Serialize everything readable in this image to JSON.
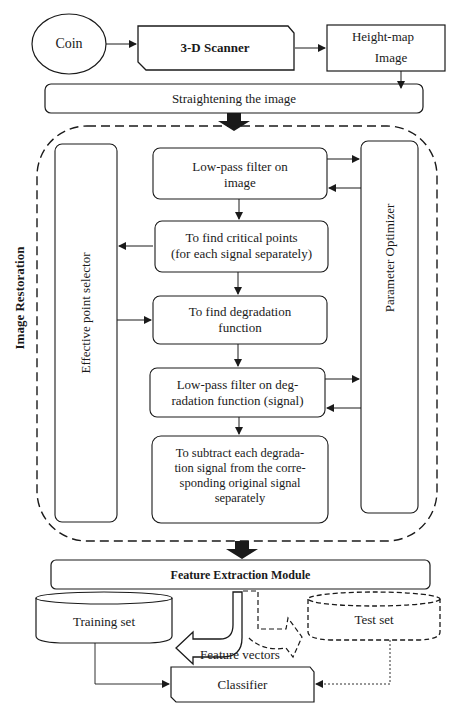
{
  "top": {
    "coin": "Coin",
    "scanner": "3-D Scanner",
    "heightmap_line1": "Height-map",
    "heightmap_line2": "Image",
    "straighten": "Straightening the image"
  },
  "restoration": {
    "group_label": "Image Restoration",
    "effective_point_selector": "Effective point selector",
    "parameter_optimizer": "Parameter Optimizer",
    "steps": [
      {
        "line1": "Low-pass filter on",
        "line2": "image"
      },
      {
        "line1": "To find critical points",
        "line2": "(for each signal separately)"
      },
      {
        "line1": "To find degradation",
        "line2": "function"
      },
      {
        "line1": "Low-pass filter on deg-",
        "line2": "radation function (signal)"
      },
      {
        "line1": "To subtract each degrada-",
        "line2": "tion signal from the corre-",
        "line3": "sponding original signal",
        "line4": "separately"
      }
    ]
  },
  "bottom": {
    "feature_extraction": "Feature Extraction Module",
    "training_set": "Training set",
    "test_set": "Test set",
    "feature_vectors": "Feature vectors",
    "classifier": "Classifier"
  },
  "colors": {
    "stroke": "#1a1a1a",
    "background": "#ffffff"
  }
}
